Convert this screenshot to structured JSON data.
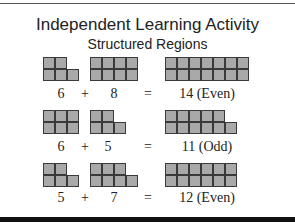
{
  "header": {
    "title": "Independent Learning Activity",
    "subtitle": "Structured Regions"
  },
  "rows": [
    {
      "a": {
        "value": "6",
        "cols": 3,
        "top": 2,
        "bottom": 3
      },
      "op": "+",
      "b": {
        "value": "8",
        "cols": 4,
        "top": 4,
        "bottom": 4
      },
      "eq": "=",
      "result": {
        "value": "14 (Even)",
        "cols": 7,
        "top": 7,
        "bottom": 7
      }
    },
    {
      "a": {
        "value": "6",
        "cols": 3,
        "top": 3,
        "bottom": 3
      },
      "op": "+",
      "b": {
        "value": "5",
        "cols": 3,
        "top": 2,
        "bottom": 3
      },
      "eq": "=",
      "result": {
        "value": "11 (Odd)",
        "cols": 6,
        "top": 5,
        "bottom": 6
      }
    },
    {
      "a": {
        "value": "5",
        "cols": 3,
        "top": 2,
        "bottom": 3
      },
      "op": "+",
      "b": {
        "value": "7",
        "cols": 4,
        "top": 3,
        "bottom": 4
      },
      "eq": "=",
      "result": {
        "value": "12 (Even)",
        "cols": 6,
        "top": 6,
        "bottom": 6
      }
    }
  ],
  "colors": {
    "cell_fill": "#a9a9a9",
    "cell_border": "#3a3a3a"
  }
}
